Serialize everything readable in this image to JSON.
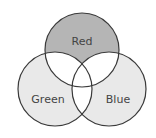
{
  "diagram": {
    "type": "venn",
    "sets": [
      {
        "id": "red",
        "label": "Red",
        "fill": "#b5b5b5",
        "cx": 82,
        "cy": 50,
        "r": 37,
        "label_x": 82,
        "label_y": 41
      },
      {
        "id": "green",
        "label": "Green",
        "fill": "#e9e9e9",
        "cx": 55,
        "cy": 89,
        "r": 37,
        "label_x": 48,
        "label_y": 103
      },
      {
        "id": "blue",
        "label": "Blue",
        "fill": "#e9e9e9",
        "cx": 109,
        "cy": 89,
        "r": 37,
        "label_x": 117,
        "label_y": 103
      }
    ],
    "intersection_fill": "#ffffff",
    "stroke": "#3a3a3a",
    "stroke_width": 1.2
  }
}
